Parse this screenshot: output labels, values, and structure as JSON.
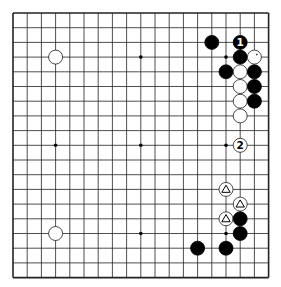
{
  "board": {
    "size": 19,
    "origin_x": 13,
    "origin_y": 13,
    "step_x": 14.2,
    "step_y": 14.7,
    "stone_radius": 7,
    "line_color": "#222222",
    "black_color": "#000000",
    "white_color": "#ffffff",
    "star_points": [
      [
        3,
        3
      ],
      [
        9,
        3
      ],
      [
        15,
        3
      ],
      [
        3,
        9
      ],
      [
        9,
        9
      ],
      [
        15,
        9
      ],
      [
        3,
        15
      ],
      [
        9,
        15
      ],
      [
        15,
        15
      ]
    ]
  },
  "stones": [
    {
      "color": "white",
      "col": 3,
      "row": 3
    },
    {
      "color": "white",
      "col": 3,
      "row": 15
    },
    {
      "color": "black",
      "col": 14,
      "row": 2
    },
    {
      "color": "black",
      "col": 16,
      "row": 2,
      "label": "1"
    },
    {
      "color": "black",
      "col": 16,
      "row": 3
    },
    {
      "color": "white",
      "col": 17,
      "row": 3,
      "mark": "dot"
    },
    {
      "color": "black",
      "col": 15,
      "row": 4
    },
    {
      "color": "white",
      "col": 16,
      "row": 4
    },
    {
      "color": "black",
      "col": 17,
      "row": 4
    },
    {
      "color": "white",
      "col": 16,
      "row": 5
    },
    {
      "color": "black",
      "col": 17,
      "row": 5
    },
    {
      "color": "white",
      "col": 16,
      "row": 6
    },
    {
      "color": "black",
      "col": 17,
      "row": 6
    },
    {
      "color": "white",
      "col": 16,
      "row": 7
    },
    {
      "color": "white",
      "col": 16,
      "row": 9,
      "label": "2"
    },
    {
      "color": "white",
      "col": 15,
      "row": 12,
      "mark": "triangle"
    },
    {
      "color": "white",
      "col": 16,
      "row": 13,
      "mark": "triangle"
    },
    {
      "color": "white",
      "col": 15,
      "row": 14,
      "mark": "triangle"
    },
    {
      "color": "black",
      "col": 16,
      "row": 14
    },
    {
      "color": "black",
      "col": 16,
      "row": 15
    },
    {
      "color": "black",
      "col": 13,
      "row": 16
    },
    {
      "color": "black",
      "col": 15,
      "row": 16
    }
  ]
}
